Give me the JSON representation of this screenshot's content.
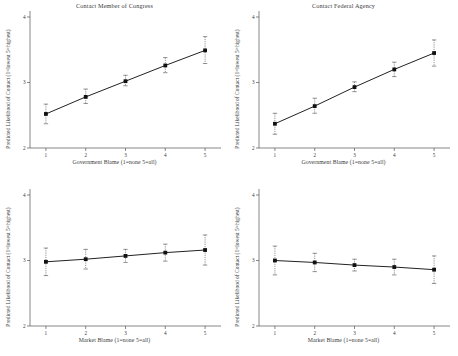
{
  "figure": {
    "width": 458,
    "height": 356,
    "background": "#ffffff",
    "line_color": "#222222",
    "marker_color": "#111111",
    "axis_color": "#555555",
    "text_color": "#3a3a3a"
  },
  "shared": {
    "ylabel": "Predicted Likelihood of Contact (1=lowest 5=highest)",
    "xlabel_government": "Government Blame (1=none 5=all)",
    "xlabel_market": "Market Blame (1=none 5=all)",
    "xticks": [
      "1",
      "2",
      "3",
      "4",
      "5"
    ]
  },
  "bottom_caption": "",
  "chart_data": [
    {
      "id": "contact-member-of-congress",
      "type": "line",
      "title": "Contact Member of Congress",
      "xlabel": "Government Blame (1=none 5=all)",
      "ylabel": "Predicted Likelihood of Contact (1=lowest 5=highest)",
      "x": [
        1,
        2,
        3,
        4,
        5
      ],
      "values": [
        2.52,
        2.78,
        3.02,
        3.26,
        3.49
      ],
      "err_low": [
        2.37,
        2.68,
        2.95,
        3.15,
        3.29
      ],
      "err_high": [
        2.67,
        2.9,
        3.11,
        3.38,
        3.7
      ],
      "xlim": [
        0.6,
        5.4
      ],
      "ylim": [
        2,
        4
      ],
      "yticks": [
        2,
        3,
        4
      ],
      "ytick_labels": [
        "2",
        "3",
        "4"
      ],
      "grid": false,
      "legend": false
    },
    {
      "id": "contact-federal-agency",
      "type": "line",
      "title": "Contact Federal Agency",
      "xlabel": "Government Blame (1=none 5=all)",
      "ylabel": "Predicted Likelihood of Contact (1=lowest 5=highest)",
      "x": [
        1,
        2,
        3,
        4,
        5
      ],
      "values": [
        2.37,
        2.64,
        2.93,
        3.2,
        3.45
      ],
      "err_low": [
        2.21,
        2.53,
        2.86,
        3.09,
        3.25
      ],
      "err_high": [
        2.53,
        2.76,
        3.01,
        3.31,
        3.65
      ],
      "xlim": [
        0.6,
        5.4
      ],
      "ylim": [
        2,
        4
      ],
      "yticks": [
        2,
        3,
        4
      ],
      "ytick_labels": [
        "2",
        "3",
        "4"
      ],
      "grid": false,
      "legend": false
    },
    {
      "id": "market-blame-member-of-congress",
      "type": "line",
      "title": "",
      "xlabel": "Market Blame (1=none 5=all)",
      "ylabel": "Predicted Likelihood of Contact (1=lowest 5=highest)",
      "x": [
        1,
        2,
        3,
        4,
        5
      ],
      "values": [
        2.98,
        3.02,
        3.07,
        3.12,
        3.16
      ],
      "err_low": [
        2.77,
        2.87,
        2.97,
        2.99,
        2.93
      ],
      "err_high": [
        3.19,
        3.17,
        3.17,
        3.25,
        3.39
      ],
      "xlim": [
        0.6,
        5.4
      ],
      "ylim": [
        2,
        4
      ],
      "yticks": [
        2,
        3,
        4
      ],
      "ytick_labels": [
        "2",
        "3",
        "4"
      ],
      "grid": false,
      "legend": false
    },
    {
      "id": "market-blame-federal-agency",
      "type": "line",
      "title": "",
      "xlabel": "Market Blame (1=none 5=all)",
      "ylabel": "Predicted Likelihood of Contact (1=lowest 5=highest)",
      "x": [
        1,
        2,
        3,
        4,
        5
      ],
      "values": [
        3.0,
        2.97,
        2.93,
        2.9,
        2.86
      ],
      "err_low": [
        2.78,
        2.83,
        2.84,
        2.78,
        2.65
      ],
      "err_high": [
        3.22,
        3.11,
        3.02,
        3.02,
        3.07
      ],
      "xlim": [
        0.6,
        5.4
      ],
      "ylim": [
        2,
        4
      ],
      "yticks": [
        2,
        3,
        4
      ],
      "ytick_labels": [
        "2",
        "3",
        "4"
      ],
      "grid": false,
      "legend": false
    }
  ]
}
